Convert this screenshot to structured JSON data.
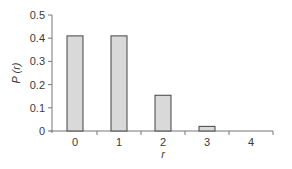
{
  "chart_data": {
    "type": "bar",
    "title": "",
    "xlabel": "r",
    "ylabel": "P (r)",
    "categories": [
      "0",
      "1",
      "2",
      "3",
      "4"
    ],
    "values": [
      0.41,
      0.41,
      0.154,
      0.02,
      0.001
    ],
    "ylim": [
      0,
      0.5
    ],
    "yticks": [
      "0",
      "0.1",
      "0.2",
      "0.3",
      "0.4",
      "0.5"
    ],
    "grid": false,
    "legend": null,
    "colors": {
      "bar_fill": "#d9d9d9",
      "bar_stroke": "#444444",
      "axis": "#777777"
    }
  }
}
